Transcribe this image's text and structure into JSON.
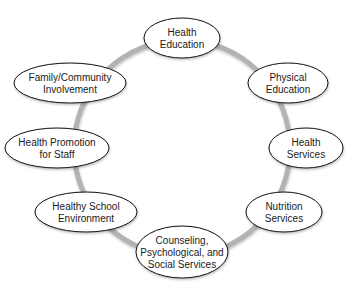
{
  "diagram": {
    "type": "cycle",
    "ring": {
      "cx": 182,
      "cy": 148,
      "r": 108,
      "color": "#b3b3b3",
      "width": 5
    },
    "node_style": {
      "fill": "#ffffff",
      "stroke": "#111111"
    },
    "nodes": [
      {
        "id": "health-education",
        "lines": [
          "Health",
          "Education"
        ],
        "cx": 182,
        "cy": 38,
        "rx": 38,
        "ry": 20
      },
      {
        "id": "physical-education",
        "lines": [
          "Physical",
          "Education"
        ],
        "cx": 288,
        "cy": 83,
        "rx": 40,
        "ry": 20
      },
      {
        "id": "health-services",
        "lines": [
          "Health",
          "Services"
        ],
        "cx": 306,
        "cy": 148,
        "rx": 37,
        "ry": 20
      },
      {
        "id": "nutrition-services",
        "lines": [
          "Nutrition",
          "Services"
        ],
        "cx": 284,
        "cy": 212,
        "rx": 38,
        "ry": 20
      },
      {
        "id": "counseling-psychological-social-services",
        "lines": [
          "Counseling,",
          "Psychological, and",
          "Social Services"
        ],
        "cx": 182,
        "cy": 252,
        "rx": 46,
        "ry": 26
      },
      {
        "id": "healthy-school-environment",
        "lines": [
          "Healthy School",
          "Environment"
        ],
        "cx": 86,
        "cy": 212,
        "rx": 51,
        "ry": 20
      },
      {
        "id": "health-promotion-for-staff",
        "lines": [
          "Health Promotion",
          "for Staff"
        ],
        "cx": 57,
        "cy": 148,
        "rx": 52,
        "ry": 20
      },
      {
        "id": "family-community-involvement",
        "lines": [
          "Family/Community",
          "Involvement"
        ],
        "cx": 70,
        "cy": 83,
        "rx": 56,
        "ry": 20
      }
    ]
  }
}
